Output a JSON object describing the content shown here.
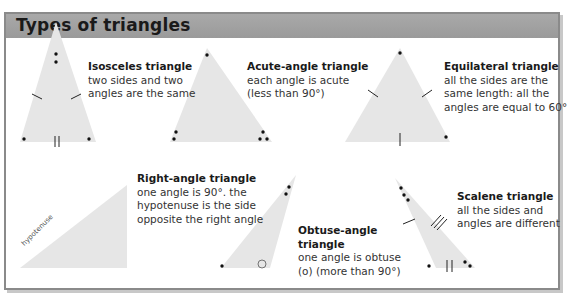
{
  "title": "Types of triangles",
  "colors": {
    "header_bg": "#9e9e9e",
    "triangle_fill": "#e6e6e6",
    "border": "#8a8a8a"
  },
  "triangles": [
    {
      "name": "Isosceles triangle",
      "desc1": "two sides and two",
      "desc2": "angles are the same"
    },
    {
      "name": "Acute-angle triangle",
      "desc1": "each angle is acute",
      "desc2": "(less than 90°)"
    },
    {
      "name": "Equilateral triangle",
      "desc1": "all the sides are the",
      "desc2": "same length: all the",
      "desc3": "angles are equal to 60°"
    },
    {
      "name": "Right-angle triangle",
      "desc1": "one angle is 90°. the",
      "desc2": "hypotenuse is the side",
      "desc3": "opposite the right angle",
      "side_label": "hypotenuse"
    },
    {
      "name": "Obtuse-angle",
      "name2": "triangle",
      "desc1": "one angle is obtuse",
      "desc2": "(o) (more than 90°)"
    },
    {
      "name": "Scalene triangle",
      "desc1": "all the sides and",
      "desc2": "angles are different"
    }
  ]
}
